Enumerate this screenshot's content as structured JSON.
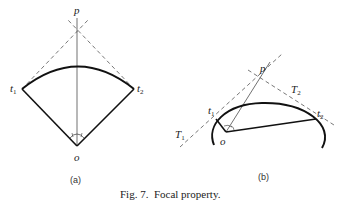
{
  "figure": {
    "caption": "Fig. 7.  Focal property.",
    "panels": [
      {
        "id": "a",
        "label": "(a)",
        "points": {
          "p": "p",
          "o": "o",
          "t1": "t",
          "t1_sub": "1",
          "t2": "t",
          "t2_sub": "2"
        }
      },
      {
        "id": "b",
        "label": "(b)",
        "points": {
          "p": "p",
          "o": "o",
          "t1": "t",
          "t1_sub": "1",
          "t2": "t",
          "t2_sub": "2",
          "T1": "T",
          "T1_sub": "1",
          "T2": "T",
          "T2_sub": "2"
        }
      }
    ]
  },
  "colors": {
    "ink": "#1a1a1a",
    "dashed": "#555555"
  }
}
